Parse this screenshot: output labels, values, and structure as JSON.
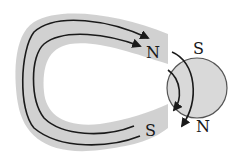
{
  "diagram": {
    "magnet": {
      "north_label": "N",
      "south_label": "S",
      "band_color": "#c8c8c8",
      "line_color": "#1a1a1a"
    },
    "sphere": {
      "top_label": "S",
      "bottom_label": "N",
      "fill_color": "#d9d9d9",
      "stroke_color": "#555555"
    }
  }
}
